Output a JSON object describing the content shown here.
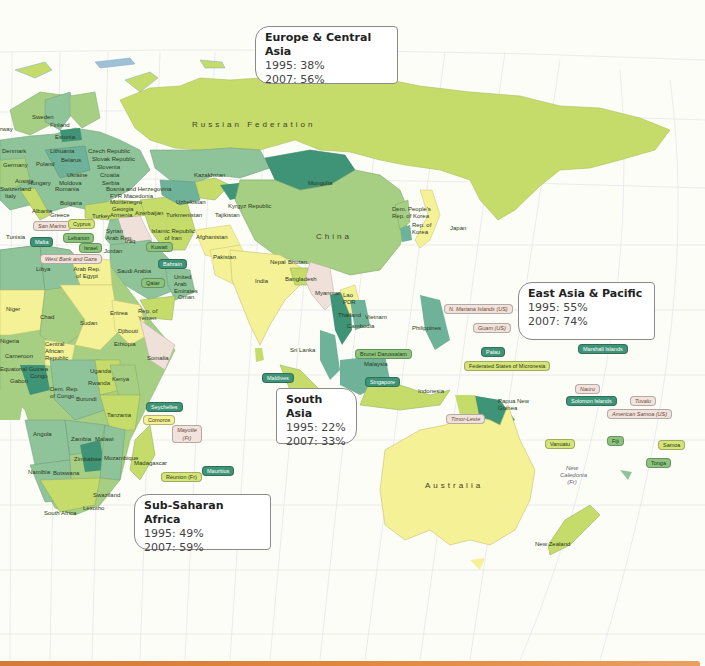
{
  "map": {
    "projection_note": "Eastern hemisphere world map",
    "region_callouts": [
      {
        "id": "europe_central_asia",
        "name": "Europe & Central Asia",
        "y1995": "1995: 38%",
        "y2007": "2007: 56%"
      },
      {
        "id": "east_asia_pacific",
        "name": "East Asia & Pacific",
        "y1995": "1995: 55%",
        "y2007": "2007: 74%"
      },
      {
        "id": "south_asia",
        "name": "South Asia",
        "y1995": "1995: 22%",
        "y2007": "2007: 33%"
      },
      {
        "id": "sub_saharan_africa",
        "name": "Sub-Saharan Africa",
        "y1995": "1995: 49%",
        "y2007": "2007: 59%"
      }
    ],
    "large_labels": {
      "russia": "Russian Federation",
      "china": "China",
      "australia": "Australia"
    },
    "country_labels": {
      "sweden": "Sweden",
      "norway": "rway",
      "finland": "Finland",
      "estonia": "Estonia",
      "latvia": "Latvia",
      "lithuania": "Lithuania",
      "denmark": "Denmark",
      "germany": "Germany",
      "poland": "Poland",
      "belarus": "Belarus",
      "czech": "Czech Republic",
      "slovak": "Slovak Republic",
      "slovenia": "Slovenia",
      "croatia": "Croatia",
      "serbia": "Serbia",
      "bosnia": "Bosnia and Herzegovina",
      "macedonia": "FYR Macedonia",
      "montenegro": "Montenegro",
      "austria": "Austria",
      "switzerland": "Switzerland",
      "italy": "Italy",
      "hungary": "Hungary",
      "moldova": "Moldova",
      "ukraine": "Ukraine",
      "romania": "Romania",
      "bulgaria": "Bulgaria",
      "albania": "Albania",
      "greece": "Greece",
      "turkey": "Turkey",
      "georgia": "Georgia",
      "armenia": "Armenia",
      "azerbaijan": "Azerbaijan",
      "kazakhstan": "Kazakhstan",
      "uzbekistan": "Uzbekistan",
      "turkmenistan": "Turkmenistan",
      "kyrgyz": "Kyrgyz Republic",
      "tajikistan": "Tajikistan",
      "mongolia": "Mongolia",
      "iran": "Islamic Republic of Iran",
      "iraq": "Iraq",
      "syria": "Syrian Arab Rep.",
      "jordan": "Jordan",
      "tunisia": "Tunisia",
      "afghanistan": "Afghanistan",
      "pakistan": "Pakistan",
      "india": "India",
      "nepal": "Nepal",
      "bhutan": "Bhutan",
      "bangladesh": "Bangladesh",
      "sri_lanka": "Sri Lanka",
      "myanmar": "Myanmar",
      "lao": "Lao PDR",
      "thailand": "Thailand",
      "vietnam": "Vietnam",
      "cambodia": "Cambodia",
      "philippines": "Philippines",
      "malaysia": "Malaysia",
      "indonesia": "Indonesia",
      "png": "Papua New Guinea",
      "dprk": "Dem. People's Rep. of Korea",
      "korea": "Rep. of Korea",
      "japan": "Japan",
      "saudi": "Saudi Arabia",
      "uae": "United Arab Emirates",
      "oman": "Oman",
      "yemen": "Rep. of Yemen",
      "egypt": "Arab Rep. of Egypt",
      "libya": "Libya",
      "niger": "Niger",
      "chad": "Chad",
      "sudan": "Sudan",
      "eritrea": "Eritrea",
      "djibouti": "Djibouti",
      "ethiopia": "Ethiopia",
      "somalia": "Somalia",
      "nigeria": "Nigeria",
      "cameroon": "Cameroon",
      "car": "Central African Republic",
      "eq_guinea": "Equatorial Guinea",
      "gabon": "Gabon",
      "congo": "Congo",
      "drc": "Dem. Rep. of Congo",
      "uganda": "Uganda",
      "kenya": "Kenya",
      "rwanda": "Rwanda",
      "burundi": "Burundi",
      "tanzania": "Tanzania",
      "angola": "Angola",
      "zambia": "Zambia",
      "malawi": "Malawi",
      "mozambique": "Mozambique",
      "zimbabwe": "Zimbabwe",
      "namibia": "Namibia",
      "botswana": "Botswana",
      "swaziland": "Swaziland",
      "lesotho": "Lesotho",
      "south_africa": "South Africa",
      "madagascar": "Madagascar",
      "new_zealand": "New Zealand",
      "new_caledonia": "New Caledonia (Fr)"
    },
    "tagged_labels": [
      {
        "text": "San Marino",
        "style": "pink"
      },
      {
        "text": "Cyprus",
        "style": "lime"
      },
      {
        "text": "Malta",
        "style": "dark"
      },
      {
        "text": "Lebanon",
        "style": "mid"
      },
      {
        "text": "Israel",
        "style": "mid"
      },
      {
        "text": "West Bank and Gaza",
        "style": "pink"
      },
      {
        "text": "Kuwait",
        "style": "mid"
      },
      {
        "text": "Bahrain",
        "style": "dark"
      },
      {
        "text": "Qatar",
        "style": "mid"
      },
      {
        "text": "Maldives",
        "style": "dark"
      },
      {
        "text": "Brunei Darussalam",
        "style": "mid"
      },
      {
        "text": "Singapore",
        "style": "dark"
      },
      {
        "text": "N. Mariana Islands (US)",
        "style": "pink"
      },
      {
        "text": "Guam (US)",
        "style": "pink"
      },
      {
        "text": "Palau",
        "style": "dark"
      },
      {
        "text": "Marshall Islands",
        "style": "dark"
      },
      {
        "text": "Federated States of Micronesia",
        "style": "lime"
      },
      {
        "text": "Nauru",
        "style": "pink"
      },
      {
        "text": "Tuvalu",
        "style": "pink"
      },
      {
        "text": "Solomon Islands",
        "style": "dark"
      },
      {
        "text": "American Samoa (US)",
        "style": "pink"
      },
      {
        "text": "Samoa",
        "style": "lime"
      },
      {
        "text": "Vanuatu",
        "style": "lime"
      },
      {
        "text": "Fiji",
        "style": "mid"
      },
      {
        "text": "Tonga",
        "style": "mid"
      },
      {
        "text": "Timor-Leste",
        "style": "pink"
      },
      {
        "text": "Seychelles",
        "style": "dark"
      },
      {
        "text": "Comoros",
        "style": "yellow"
      },
      {
        "text": "Mayotte (Fr)",
        "style": "pink"
      },
      {
        "text": "Mauritius",
        "style": "dark"
      },
      {
        "text": "Réunion (Fr)",
        "style": "lime"
      }
    ],
    "colors": {
      "ocean": "#fdfdf8",
      "grid": "#e4e6ea",
      "lime": "#c6dc6a",
      "yellow": "#f4f196",
      "light_green": "#a7cf83",
      "sage": "#8fc39a",
      "teal": "#6fb29a",
      "dark_teal": "#3f9477",
      "no_data": "#efe0d9",
      "bottom_bar": "#e0873e"
    }
  }
}
